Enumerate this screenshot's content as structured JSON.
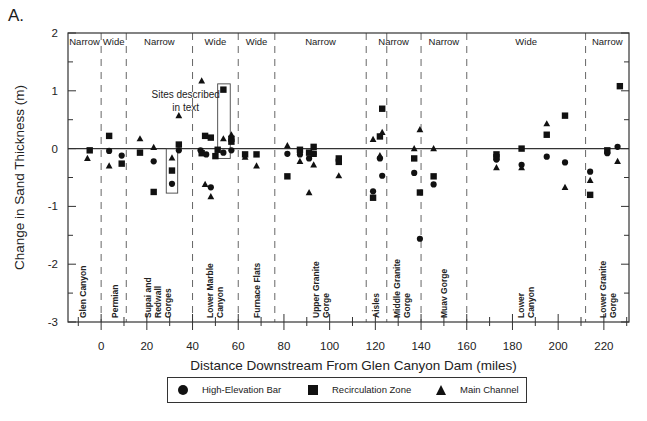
{
  "panel_label": "A.",
  "chart_data": {
    "type": "scatter",
    "title": "",
    "xlabel": "Distance Downstream From Glen Canyon Dam (miles)",
    "ylabel": "Change in Sand Thickness (m)",
    "xlim": [
      -14.5,
      231
    ],
    "ylim": [
      -3,
      2
    ],
    "xticks": [
      0,
      20,
      40,
      60,
      80,
      100,
      120,
      140,
      160,
      180,
      200,
      220
    ],
    "xminor_ticks": [
      -10,
      10,
      30,
      50,
      70,
      90,
      110,
      130,
      150,
      170,
      190,
      210,
      230
    ],
    "yticks": [
      2,
      1,
      0,
      -1,
      -2,
      -3
    ],
    "yminor_ticks": [
      1.5,
      0.5,
      -0.5,
      -1.5,
      -2.5
    ],
    "zero_line": true,
    "grid": false,
    "legend_position": "bottom-center",
    "reach_boundaries": [
      0,
      11,
      40,
      60,
      76,
      116,
      125,
      140,
      160,
      212
    ],
    "reach_widths": [
      {
        "label": "Narrow",
        "from": -14.5,
        "to": 0
      },
      {
        "label": "Wide",
        "from": 0,
        "to": 11
      },
      {
        "label": "Narrow",
        "from": 11,
        "to": 40
      },
      {
        "label": "Wide",
        "from": 40,
        "to": 60
      },
      {
        "label": "Wide",
        "from": 60,
        "to": 76
      },
      {
        "label": "Narrow",
        "from": 76,
        "to": 116
      },
      {
        "label": "Narrow",
        "from": 116,
        "to": 140
      },
      {
        "label": "Narrow",
        "from": 140,
        "to": 160
      },
      {
        "label": "Wide",
        "from": 160,
        "to": 212
      },
      {
        "label": "Narrow",
        "from": 212,
        "to": 231
      }
    ],
    "regions": [
      {
        "lines": [
          "Glen Canyon"
        ],
        "x": -8
      },
      {
        "lines": [
          "Permian"
        ],
        "x": 6
      },
      {
        "lines": [
          "Supai and",
          "Redwall",
          "Gorges"
        ],
        "x": 25
      },
      {
        "lines": [
          "Lower Marble",
          "Canyon"
        ],
        "x": 50
      },
      {
        "lines": [
          "Furnace Flats"
        ],
        "x": 68
      },
      {
        "lines": [
          "Upper Granite",
          "Gorge"
        ],
        "x": 96
      },
      {
        "lines": [
          "Aisles"
        ],
        "x": 120.5
      },
      {
        "lines": [
          "Middle Granite",
          "Gorge"
        ],
        "x": 131.5
      },
      {
        "lines": [
          "Muav Gorge"
        ],
        "x": 150
      },
      {
        "lines": [
          "Lower",
          "Canyon"
        ],
        "x": 186
      },
      {
        "lines": [
          "Lower Granite",
          "Gorge"
        ],
        "x": 222
      }
    ],
    "annotation": {
      "lines": [
        "Sites described",
        "in text"
      ],
      "x": 37,
      "y": 0.88
    },
    "highlight_boxes": [
      {
        "x0": 28.5,
        "x1": 33.5,
        "y0": -0.77,
        "y1": 0.0
      },
      {
        "x0": 51,
        "x1": 56.5,
        "y0": -0.17,
        "y1": 1.12
      }
    ],
    "series": [
      {
        "name": "High-Elevation Bar",
        "marker": "circle",
        "points": [
          [
            3.5,
            -0.04
          ],
          [
            9,
            -0.12
          ],
          [
            23,
            -0.22
          ],
          [
            31,
            -0.61
          ],
          [
            34,
            -0.03
          ],
          [
            43.5,
            -0.03
          ],
          [
            46,
            -0.1
          ],
          [
            48,
            -0.67
          ],
          [
            53.5,
            -0.07
          ],
          [
            57,
            -0.03
          ],
          [
            81.5,
            -0.09
          ],
          [
            87,
            -0.1
          ],
          [
            91,
            -0.17
          ],
          [
            93,
            -0.09
          ],
          [
            119,
            -0.74
          ],
          [
            122,
            -0.17
          ],
          [
            123,
            -0.47
          ],
          [
            137,
            -0.42
          ],
          [
            139.5,
            -1.56
          ],
          [
            145.5,
            -0.62
          ],
          [
            173,
            -0.19
          ],
          [
            184,
            -0.28
          ],
          [
            195,
            -0.14
          ],
          [
            203,
            -0.24
          ],
          [
            214,
            -0.4
          ],
          [
            221.5,
            -0.08
          ],
          [
            226,
            0.03
          ]
        ]
      },
      {
        "name": "Recirculation Zone",
        "marker": "square",
        "points": [
          [
            -5,
            -0.03
          ],
          [
            3.5,
            0.22
          ],
          [
            9,
            -0.26
          ],
          [
            17,
            -0.07
          ],
          [
            23,
            -0.75
          ],
          [
            31,
            -0.38
          ],
          [
            34,
            0.07
          ],
          [
            44,
            -0.08
          ],
          [
            45.5,
            0.22
          ],
          [
            48,
            0.19
          ],
          [
            50,
            -0.13
          ],
          [
            51,
            -0.02
          ],
          [
            53.5,
            1.02
          ],
          [
            57,
            0.17
          ],
          [
            57,
            0.12
          ],
          [
            63,
            -0.1
          ],
          [
            68,
            -0.1
          ],
          [
            81.5,
            -0.48
          ],
          [
            87,
            -0.02
          ],
          [
            91,
            -0.07
          ],
          [
            93,
            0.03
          ],
          [
            93,
            -0.09
          ],
          [
            104,
            -0.17
          ],
          [
            104,
            -0.23
          ],
          [
            119,
            -0.85
          ],
          [
            122,
            0.21
          ],
          [
            123,
            0.69
          ],
          [
            137,
            -0.17
          ],
          [
            139.5,
            -0.76
          ],
          [
            145.5,
            -0.48
          ],
          [
            173,
            -0.1
          ],
          [
            173,
            -0.15
          ],
          [
            184,
            0.0
          ],
          [
            195,
            0.24
          ],
          [
            203,
            0.57
          ],
          [
            214,
            -0.8
          ],
          [
            221.5,
            -0.03
          ],
          [
            227,
            1.08
          ]
        ]
      },
      {
        "name": "Main Channel",
        "marker": "triangle",
        "points": [
          [
            -6,
            -0.17
          ],
          [
            3.5,
            -0.3
          ],
          [
            17,
            0.17
          ],
          [
            23,
            0.02
          ],
          [
            31,
            -0.16
          ],
          [
            34,
            0.57
          ],
          [
            44,
            1.17
          ],
          [
            45.5,
            -0.62
          ],
          [
            48,
            -0.83
          ],
          [
            53.5,
            0.17
          ],
          [
            57,
            0.24
          ],
          [
            63,
            -0.15
          ],
          [
            68,
            -0.3
          ],
          [
            81.5,
            0.05
          ],
          [
            87,
            -0.22
          ],
          [
            91,
            -0.76
          ],
          [
            93,
            -0.28
          ],
          [
            104,
            -0.47
          ],
          [
            119,
            0.16
          ],
          [
            122,
            -0.12
          ],
          [
            123,
            0.28
          ],
          [
            137,
            0.0
          ],
          [
            139.5,
            0.33
          ],
          [
            145.5,
            0.0
          ],
          [
            173,
            -0.33
          ],
          [
            184,
            -0.33
          ],
          [
            195,
            0.43
          ],
          [
            203,
            -0.67
          ],
          [
            214,
            -0.55
          ],
          [
            226,
            -0.22
          ]
        ]
      }
    ]
  },
  "legend": {
    "items": [
      {
        "label": "High-Elevation Bar",
        "marker": "circle"
      },
      {
        "label": "Recirculation Zone",
        "marker": "square"
      },
      {
        "label": "Main Channel",
        "marker": "triangle"
      }
    ]
  }
}
